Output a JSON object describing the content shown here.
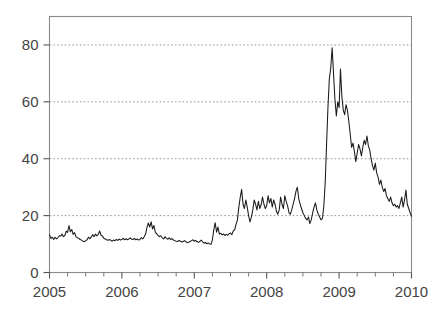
{
  "chart_data": {
    "type": "line",
    "title": "",
    "subtitle": "",
    "xlabel": "",
    "ylabel": "",
    "xlim": [
      2005.0,
      2010.0
    ],
    "ylim": [
      0,
      90
    ],
    "grid": true,
    "grid_axis": "y",
    "legend": false,
    "legend_position": "none",
    "line_color": "#1a1a1a",
    "frame_color": "#8a8a8a",
    "gridline_color": "#8a8a8a",
    "background_color": "#ffffff",
    "yticks": [
      0,
      20,
      40,
      60,
      80
    ],
    "ytick_labels": [
      "0",
      "20",
      "40",
      "60",
      "80"
    ],
    "xticks": [
      2005,
      2006,
      2007,
      2008,
      2009,
      2010
    ],
    "xtick_labels": [
      "2005",
      "2006",
      "2007",
      "2008",
      "2009",
      "2010"
    ],
    "x_minor_ticks_per_interval": 4,
    "series": [
      {
        "name": "volatility-index",
        "x": [
          2005.0,
          2005.019,
          2005.038,
          2005.058,
          2005.077,
          2005.096,
          2005.115,
          2005.135,
          2005.154,
          2005.173,
          2005.192,
          2005.212,
          2005.231,
          2005.25,
          2005.269,
          2005.288,
          2005.308,
          2005.327,
          2005.346,
          2005.365,
          2005.385,
          2005.404,
          2005.423,
          2005.442,
          2005.462,
          2005.481,
          2005.5,
          2005.519,
          2005.538,
          2005.558,
          2005.577,
          2005.596,
          2005.615,
          2005.635,
          2005.654,
          2005.673,
          2005.692,
          2005.712,
          2005.731,
          2005.75,
          2005.769,
          2005.788,
          2005.808,
          2005.827,
          2005.846,
          2005.865,
          2005.885,
          2005.904,
          2005.923,
          2005.942,
          2005.962,
          2005.981,
          2006.0,
          2006.019,
          2006.038,
          2006.058,
          2006.077,
          2006.096,
          2006.115,
          2006.135,
          2006.154,
          2006.173,
          2006.192,
          2006.212,
          2006.231,
          2006.25,
          2006.269,
          2006.288,
          2006.308,
          2006.327,
          2006.346,
          2006.365,
          2006.385,
          2006.404,
          2006.423,
          2006.442,
          2006.462,
          2006.481,
          2006.5,
          2006.519,
          2006.538,
          2006.558,
          2006.577,
          2006.596,
          2006.615,
          2006.635,
          2006.654,
          2006.673,
          2006.692,
          2006.712,
          2006.731,
          2006.75,
          2006.769,
          2006.788,
          2006.808,
          2006.827,
          2006.846,
          2006.865,
          2006.885,
          2006.904,
          2006.923,
          2006.942,
          2006.962,
          2006.981,
          2007.0,
          2007.019,
          2007.038,
          2007.058,
          2007.077,
          2007.096,
          2007.115,
          2007.135,
          2007.154,
          2007.173,
          2007.192,
          2007.212,
          2007.231,
          2007.25,
          2007.269,
          2007.288,
          2007.308,
          2007.327,
          2007.346,
          2007.365,
          2007.385,
          2007.404,
          2007.423,
          2007.442,
          2007.462,
          2007.481,
          2007.5,
          2007.519,
          2007.538,
          2007.558,
          2007.577,
          2007.596,
          2007.615,
          2007.635,
          2007.654,
          2007.673,
          2007.692,
          2007.712,
          2007.731,
          2007.75,
          2007.769,
          2007.788,
          2007.808,
          2007.827,
          2007.846,
          2007.865,
          2007.885,
          2007.904,
          2007.923,
          2007.942,
          2007.962,
          2007.981,
          2008.0,
          2008.019,
          2008.038,
          2008.058,
          2008.077,
          2008.096,
          2008.115,
          2008.135,
          2008.154,
          2008.173,
          2008.192,
          2008.212,
          2008.231,
          2008.25,
          2008.269,
          2008.288,
          2008.308,
          2008.327,
          2008.346,
          2008.365,
          2008.385,
          2008.404,
          2008.423,
          2008.442,
          2008.462,
          2008.481,
          2008.5,
          2008.519,
          2008.538,
          2008.558,
          2008.577,
          2008.596,
          2008.615,
          2008.635,
          2008.654,
          2008.673,
          2008.692,
          2008.712,
          2008.731,
          2008.75,
          2008.769,
          2008.788,
          2008.808,
          2008.827,
          2008.846,
          2008.865,
          2008.885,
          2008.904,
          2008.923,
          2008.942,
          2008.962,
          2008.981,
          2009.0,
          2009.019,
          2009.038,
          2009.058,
          2009.077,
          2009.096,
          2009.115,
          2009.135,
          2009.154,
          2009.173,
          2009.192,
          2009.212,
          2009.231,
          2009.25,
          2009.269,
          2009.288,
          2009.308,
          2009.327,
          2009.346,
          2009.365,
          2009.385,
          2009.404,
          2009.423,
          2009.442,
          2009.462,
          2009.481,
          2009.5,
          2009.519,
          2009.538,
          2009.558,
          2009.577,
          2009.596,
          2009.615,
          2009.635,
          2009.654,
          2009.673,
          2009.692,
          2009.712,
          2009.731,
          2009.75,
          2009.769,
          2009.788,
          2009.808,
          2009.827,
          2009.846,
          2009.865,
          2009.885,
          2009.904,
          2009.923,
          2009.942,
          2009.962,
          2009.981,
          2010.0
        ],
        "values": [
          13.3,
          12.0,
          12.4,
          11.6,
          12.4,
          11.8,
          12.2,
          12.9,
          12.8,
          13.5,
          12.6,
          13.0,
          14.5,
          14.1,
          16.5,
          14.3,
          15.1,
          13.4,
          14.0,
          12.6,
          12.2,
          12.0,
          11.6,
          11.4,
          11.0,
          10.8,
          11.2,
          11.5,
          12.4,
          11.9,
          12.5,
          13.3,
          12.6,
          13.5,
          12.9,
          13.4,
          14.6,
          13.1,
          12.8,
          12.1,
          11.8,
          11.5,
          11.3,
          11.6,
          11.3,
          11.0,
          11.4,
          11.2,
          11.6,
          11.3,
          11.7,
          11.4,
          11.6,
          12.0,
          11.5,
          11.9,
          11.5,
          11.8,
          12.2,
          11.7,
          11.6,
          12.0,
          11.5,
          11.8,
          11.4,
          11.6,
          12.3,
          11.8,
          12.6,
          13.5,
          15.8,
          17.4,
          16.0,
          17.8,
          15.3,
          16.5,
          14.2,
          13.6,
          13.0,
          12.6,
          12.9,
          12.2,
          11.8,
          12.6,
          12.0,
          11.7,
          12.2,
          11.6,
          11.9,
          11.4,
          11.2,
          11.0,
          10.9,
          11.3,
          11.0,
          10.7,
          10.9,
          11.2,
          10.8,
          10.5,
          10.6,
          10.9,
          11.2,
          11.5,
          11.0,
          11.3,
          10.8,
          10.6,
          10.9,
          11.4,
          10.8,
          10.3,
          10.6,
          10.1,
          10.4,
          10.0,
          9.9,
          11.5,
          15.0,
          17.5,
          14.2,
          16.0,
          13.5,
          13.8,
          13.2,
          13.6,
          13.0,
          13.4,
          13.1,
          13.6,
          13.9,
          13.3,
          14.6,
          15.1,
          17.0,
          18.5,
          23.0,
          26.5,
          29.2,
          24.0,
          22.5,
          25.5,
          23.0,
          20.0,
          17.8,
          19.5,
          22.0,
          25.5,
          24.0,
          22.0,
          25.0,
          22.5,
          23.8,
          26.5,
          24.0,
          22.5,
          23.5,
          27.0,
          24.5,
          26.0,
          23.0,
          25.5,
          24.0,
          21.5,
          20.5,
          22.0,
          26.5,
          24.0,
          22.5,
          27.0,
          25.0,
          23.5,
          21.0,
          20.5,
          22.0,
          24.0,
          26.0,
          28.5,
          30.0,
          26.0,
          24.0,
          22.5,
          21.0,
          20.0,
          19.0,
          18.5,
          19.5,
          17.2,
          18.5,
          21.0,
          23.0,
          24.5,
          22.0,
          20.5,
          19.5,
          18.5,
          19.0,
          23.0,
          31.5,
          45.0,
          58.0,
          68.0,
          72.0,
          79.0,
          70.0,
          61.0,
          55.0,
          60.0,
          58.0,
          71.5,
          62.0,
          57.0,
          55.5,
          59.0,
          57.0,
          53.0,
          48.5,
          44.0,
          45.5,
          42.5,
          39.0,
          42.0,
          45.0,
          43.5,
          41.0,
          44.0,
          46.5,
          45.0,
          48.0,
          44.5,
          43.0,
          40.0,
          37.5,
          36.0,
          38.5,
          35.0,
          33.5,
          31.0,
          32.5,
          30.0,
          28.5,
          29.5,
          27.0,
          26.0,
          25.0,
          26.5,
          24.5,
          23.5,
          24.0,
          23.0,
          23.5,
          22.5,
          24.5,
          26.5,
          23.0,
          25.5,
          29.0,
          24.0,
          22.5,
          21.0,
          19.8
        ]
      }
    ]
  },
  "axes": {
    "y_axis_name": "value-axis",
    "x_axis_name": "time-axis"
  }
}
